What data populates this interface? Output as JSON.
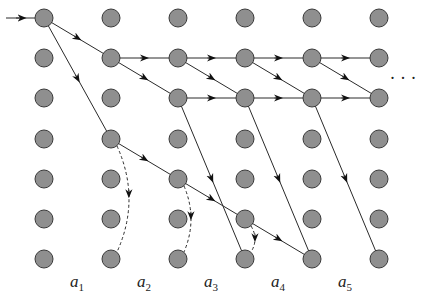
{
  "diagram": {
    "type": "grid-graph",
    "grid": {
      "columns_x": [
        44,
        111,
        178,
        245,
        312,
        379
      ],
      "rows_y": [
        18,
        58,
        98,
        139,
        179,
        219,
        259
      ],
      "node_radius": 9,
      "node_fill": "#8f8f8f",
      "node_stroke": "#3a3a3a"
    },
    "entry_arrow": {
      "from": [
        6,
        18
      ],
      "to": [
        35,
        18
      ]
    },
    "solid_edges": [
      {
        "from": [
          0,
          0
        ],
        "to": [
          1,
          1
        ]
      },
      {
        "from": [
          0,
          0
        ],
        "to": [
          1,
          3
        ]
      },
      {
        "from": [
          1,
          1
        ],
        "to": [
          2,
          1
        ]
      },
      {
        "from": [
          1,
          1
        ],
        "to": [
          2,
          2
        ]
      },
      {
        "from": [
          2,
          1
        ],
        "to": [
          3,
          1
        ]
      },
      {
        "from": [
          2,
          1
        ],
        "to": [
          3,
          2
        ]
      },
      {
        "from": [
          2,
          2
        ],
        "to": [
          3,
          2
        ]
      },
      {
        "from": [
          3,
          1
        ],
        "to": [
          4,
          1
        ]
      },
      {
        "from": [
          3,
          1
        ],
        "to": [
          4,
          2
        ]
      },
      {
        "from": [
          3,
          2
        ],
        "to": [
          4,
          2
        ]
      },
      {
        "from": [
          4,
          1
        ],
        "to": [
          5,
          1
        ]
      },
      {
        "from": [
          4,
          1
        ],
        "to": [
          5,
          2
        ]
      },
      {
        "from": [
          4,
          2
        ],
        "to": [
          5,
          2
        ]
      },
      {
        "from": [
          1,
          3
        ],
        "to": [
          2,
          4
        ]
      },
      {
        "from": [
          2,
          4
        ],
        "to": [
          3,
          5
        ]
      },
      {
        "from": [
          3,
          5
        ],
        "to": [
          4,
          6
        ]
      },
      {
        "from": [
          2,
          2
        ],
        "to": [
          3,
          6
        ]
      },
      {
        "from": [
          3,
          2
        ],
        "to": [
          4,
          6
        ]
      },
      {
        "from": [
          4,
          2
        ],
        "to": [
          5,
          6
        ]
      }
    ],
    "dashed_edges": [
      {
        "from": [
          1,
          3
        ],
        "to": [
          1,
          6
        ]
      },
      {
        "from": [
          2,
          4
        ],
        "to": [
          2,
          6
        ]
      },
      {
        "from": [
          3,
          5
        ],
        "to": [
          3,
          6
        ]
      }
    ],
    "ellipsis": {
      "text": "· · ·",
      "x": 403,
      "y": 84
    },
    "labels": [
      {
        "base": "a",
        "sub": "1",
        "x": 70
      },
      {
        "base": "a",
        "sub": "2",
        "x": 137
      },
      {
        "base": "a",
        "sub": "3",
        "x": 204
      },
      {
        "base": "a",
        "sub": "4",
        "x": 271
      },
      {
        "base": "a",
        "sub": "5",
        "x": 338
      }
    ],
    "label_y": 287
  }
}
